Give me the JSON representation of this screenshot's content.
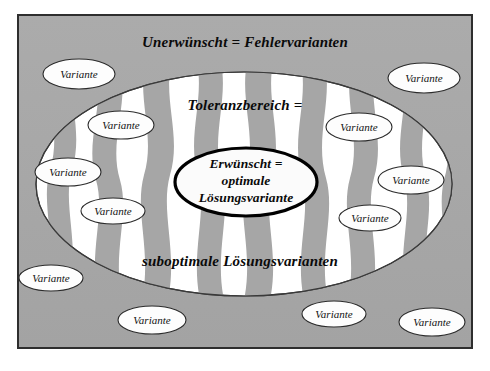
{
  "diagram": {
    "title_text": "Unerwünscht = Fehlervarianten",
    "zones": {
      "outer": {
        "name": "outer-error-zone",
        "label": "Unerwünscht = Fehlervarianten",
        "fill_color": "#a6a6a6"
      },
      "tolerance": {
        "name": "tolerance-zone",
        "label_top": "Toleranzbereich =",
        "label_bottom": "suboptimale Lösungsvarianten",
        "fill_color": "#ffffff",
        "stripe_color": "#a6a6a6"
      },
      "core": {
        "name": "optimal-core-zone",
        "label_line1": "Erwünscht =",
        "label_line2": "optimale",
        "label_line3": "Lösungsvariante",
        "fill_color": "#fbfbfb",
        "stroke_color": "#000000"
      }
    },
    "variant_label": "Variante",
    "variants": [
      {
        "id": "v1",
        "label": "Variante",
        "cx": 79,
        "cy": 74,
        "rx": 36,
        "ry": 15,
        "zone": "outer"
      },
      {
        "id": "v2",
        "label": "Variante",
        "cx": 424,
        "cy": 78,
        "rx": 36,
        "ry": 15,
        "zone": "outer"
      },
      {
        "id": "v3",
        "label": "Variante",
        "cx": 121,
        "cy": 125,
        "rx": 33,
        "ry": 14,
        "zone": "tolerance"
      },
      {
        "id": "v4",
        "label": "Variante",
        "cx": 359,
        "cy": 127,
        "rx": 33,
        "ry": 14,
        "zone": "tolerance"
      },
      {
        "id": "v5",
        "label": "Variante",
        "cx": 68,
        "cy": 172,
        "rx": 33,
        "ry": 14,
        "zone": "tolerance"
      },
      {
        "id": "v6",
        "label": "Variante",
        "cx": 411,
        "cy": 180,
        "rx": 33,
        "ry": 14,
        "zone": "tolerance"
      },
      {
        "id": "v7",
        "label": "Variante",
        "cx": 113,
        "cy": 211,
        "rx": 32,
        "ry": 13,
        "zone": "tolerance"
      },
      {
        "id": "v8",
        "label": "Variante",
        "cx": 370,
        "cy": 218,
        "rx": 31,
        "ry": 13,
        "zone": "tolerance"
      },
      {
        "id": "v9",
        "label": "Variante",
        "cx": 51,
        "cy": 278,
        "rx": 32,
        "ry": 13,
        "zone": "outer"
      },
      {
        "id": "v10",
        "label": "Variante",
        "cx": 152,
        "cy": 320,
        "rx": 34,
        "ry": 14,
        "zone": "outer"
      },
      {
        "id": "v11",
        "label": "Variante",
        "cx": 334,
        "cy": 314,
        "rx": 32,
        "ry": 13,
        "zone": "outer"
      },
      {
        "id": "v12",
        "label": "Variante",
        "cx": 432,
        "cy": 322,
        "rx": 33,
        "ry": 14,
        "zone": "outer"
      }
    ],
    "frame": {
      "x": 18,
      "y": 15,
      "width": 454,
      "height": 333,
      "stroke_color": "#2e2e2e",
      "fill_color": "#a6a6a6"
    },
    "tolerance_ellipse": {
      "cx": 244,
      "cy": 184,
      "rx": 208,
      "ry": 112
    },
    "core_ellipse": {
      "cx": 246,
      "cy": 182,
      "rx": 71,
      "ry": 34
    }
  }
}
